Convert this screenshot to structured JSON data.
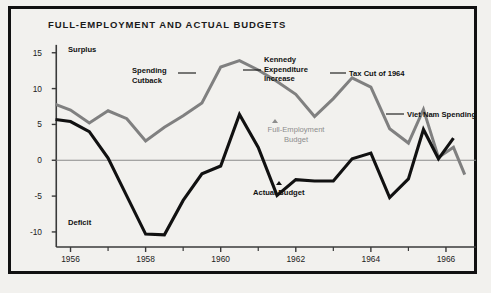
{
  "figure": {
    "title": "FULL-EMPLOYMENT AND ACTUAL BUDGETS",
    "background": "#f2f1ee",
    "frame_color": "#111111"
  },
  "axes": {
    "y_ticks": [
      "15",
      "10",
      "5",
      "0",
      "-5",
      "-10"
    ],
    "x_ticks": [
      "1956",
      "1958",
      "1960",
      "1962",
      "1964",
      "1966"
    ],
    "zone_top": "Surplus",
    "zone_bottom": "Deficit"
  },
  "annotations": {
    "spending_cutback": "Spending\nCutback",
    "spending_cutback_l1": "Spending",
    "spending_cutback_l2": "Cutback",
    "kennedy_l1": "Kennedy",
    "kennedy_l2": "Expenditure",
    "kennedy_l3": "Increase",
    "tax_cut": "Tax Cut of 1964",
    "viet_nam": "Viet Nam Spending",
    "full_employment_l1": "Full-Employment",
    "full_employment_l2": "Budget",
    "actual_budget": "Actual Budget"
  },
  "chart_data": {
    "type": "line",
    "title": "FULL-EMPLOYMENT AND ACTUAL BUDGETS",
    "xlabel": "",
    "ylabel": "",
    "xlim": [
      1955.4,
      1966.8
    ],
    "ylim": [
      -12.8,
      16.5
    ],
    "grid": false,
    "legend": "inline-annotations",
    "zero_line": 0,
    "x": [
      1955.6,
      1956.0,
      1956.5,
      1957.0,
      1957.5,
      1958.0,
      1958.5,
      1959.0,
      1959.5,
      1960.0,
      1960.5,
      1961.0,
      1961.5,
      1962.0,
      1962.5,
      1963.0,
      1963.5,
      1964.0,
      1964.5,
      1965.0,
      1965.4,
      1965.8,
      1966.2,
      1966.5
    ],
    "series": [
      {
        "name": "Full-Employment Budget",
        "color": "#808080",
        "values": [
          7.8,
          7.0,
          5.2,
          6.9,
          5.8,
          2.7,
          4.6,
          6.2,
          8.0,
          13.0,
          13.9,
          12.6,
          11.0,
          9.2,
          6.1,
          8.6,
          11.5,
          10.2,
          4.4,
          2.4,
          7.1,
          0.4,
          1.8,
          -2.0
        ]
      },
      {
        "name": "Actual Budget",
        "color": "#111111",
        "values": [
          5.7,
          5.4,
          4.0,
          0.3,
          -5.0,
          -10.3,
          -10.4,
          -5.6,
          -1.9,
          -0.8,
          6.4,
          1.8,
          -4.9,
          -2.7,
          -2.9,
          -2.9,
          0.2,
          1.0,
          -5.2,
          -2.6,
          4.3,
          0.2,
          3.1,
          null
        ]
      }
    ],
    "annotations": [
      {
        "text": "Surplus",
        "x": 1956.1,
        "y": 15.0
      },
      {
        "text": "Deficit",
        "x": 1956.1,
        "y": -10.6
      },
      {
        "text": "Spending Cutback",
        "x": 1958.3,
        "y": 11.5
      },
      {
        "text": "Kennedy Expenditure Increase",
        "x": 1961.9,
        "y": 13.2
      },
      {
        "text": "Tax Cut of 1964",
        "x": 1963.8,
        "y": 10.5
      },
      {
        "text": "Viet Nam Spending",
        "x": 1965.5,
        "y": 5.2
      },
      {
        "text": "Full-Employment Budget",
        "x": 1961.8,
        "y": 3.6
      },
      {
        "text": "Actual Budget",
        "x": 1961.7,
        "y": -4.6
      }
    ]
  }
}
